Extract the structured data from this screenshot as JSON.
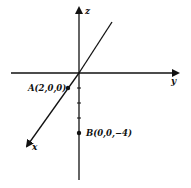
{
  "diagram": {
    "type": "3d-coordinate-axes",
    "axes": {
      "x": {
        "label": "x"
      },
      "y": {
        "label": "y"
      },
      "z": {
        "label": "z"
      }
    },
    "points": [
      {
        "name": "A",
        "label": "A(2,0,0)",
        "coords": [
          2,
          0,
          0
        ]
      },
      {
        "name": "B",
        "label": "B(0,0,−4)",
        "coords": [
          0,
          0,
          -4
        ]
      }
    ],
    "colors": {
      "ink": "#111111",
      "background": "#ffffff"
    }
  }
}
